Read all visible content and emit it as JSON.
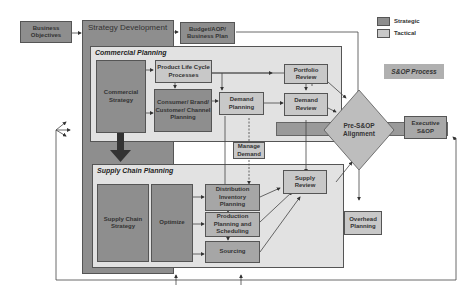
{
  "legend": {
    "items": [
      {
        "label": "Strategic",
        "color": "#8e8e8e"
      },
      {
        "label": "Tactical",
        "color": "#c8c8c8"
      }
    ]
  },
  "process_label": "S&OP Process",
  "nodes": {
    "business_objectives": "Business Objectives",
    "strategy_development": "Strategy Development",
    "budget_plan": "Budget/AOP/ Business Plan",
    "commercial_planning": "Commercial Planning",
    "commercial_strategy": "Commercial Strategy",
    "product_life_cycle": "Product Life Cycle Processes",
    "consumer_brand": "Consumer/ Brand/ Customer/ Channel Planning",
    "demand_planning": "Demand Planning",
    "portfolio_review": "Portfolio Review",
    "demand_review": "Demand Review",
    "manage_demand": "Manage Demand",
    "pre_sop": "Pre-S&OP Alignment",
    "executive_sop": "Executive S&OP",
    "supply_chain_planning": "Supply Chain Planning",
    "supply_chain_strategy": "Supply Chain Strategy",
    "optimize": "Optimize",
    "distribution_inventory": "Distribution Inventory Planning",
    "production_planning": "Production Planning and Scheduling",
    "sourcing": "Sourcing",
    "supply_review": "Supply Review",
    "overhead_planning": "Overhead Planning"
  }
}
